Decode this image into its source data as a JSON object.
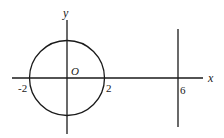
{
  "diagram": {
    "axes": {
      "x_label": "x",
      "y_label": "y",
      "origin_label": "O"
    },
    "circle": {
      "center": [
        0,
        0
      ],
      "radius": 2,
      "left_intercept_label": "-2",
      "right_intercept_label": "2"
    },
    "vertical_line": {
      "x_value": 6,
      "label": "6"
    },
    "colors": {
      "stroke": "#1a1a1a",
      "background": "#ffffff"
    }
  }
}
